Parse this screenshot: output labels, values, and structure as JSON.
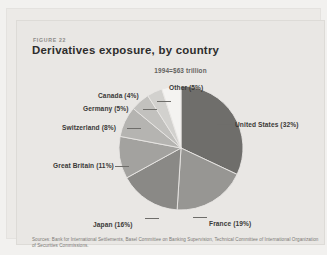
{
  "figure": {
    "number_label": "FIGURE 22",
    "title": "Derivatives exposure, by country",
    "subtitle": "1994=$63 trillion"
  },
  "source": {
    "text": "Sources: Bank for International Settlements, Basel Committee on Banking Supervision, Technical Committee of International Organization of Securities Commissions."
  },
  "labels": {
    "united_states": "United States (32%)",
    "france": "France (19%)",
    "japan": "Japan (16%)",
    "great_britain": "Great Britain (11%)",
    "switzerland": "Switzerland (8%)",
    "germany": "Germany (5%)",
    "canada": "Canada (4%)",
    "other": "Other (5%)"
  },
  "chart_data": {
    "type": "pie",
    "title": "Derivatives exposure, by country",
    "subtitle": "1994=$63 trillion",
    "unit": "percent of total",
    "total_label": "$63 trillion",
    "start_angle_deg": 0,
    "direction": "clockwise",
    "legend": "none-labels-outside",
    "categories": [
      "United States",
      "France",
      "Japan",
      "Great Britain",
      "Switzerland",
      "Germany",
      "Canada",
      "Other"
    ],
    "values": [
      32,
      19,
      16,
      11,
      8,
      5,
      4,
      5
    ],
    "labels": [
      "United States (32%)",
      "France (19%)",
      "Japan (16%)",
      "Great Britain (11%)",
      "Switzerland (8%)",
      "Germany (5%)",
      "Canada (4%)",
      "Other (5%)"
    ],
    "colors": [
      "#6f6e6b",
      "#979693",
      "#8a8986",
      "#a3a29f",
      "#b5b4b1",
      "#c2c1be",
      "#d2d1ce",
      "#f4f3f1"
    ]
  },
  "theme": {
    "page_bg": "#f2f1ef",
    "panel_bg": "#e9e7e4",
    "title_color": "#2e2d2c",
    "label_color": "#3a3937",
    "source_color": "#7c7a77"
  }
}
